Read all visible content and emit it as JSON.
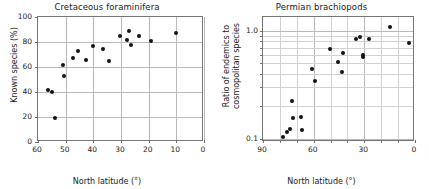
{
  "figure": {
    "panels": [
      {
        "id": "cretaceous-foraminifera",
        "title": "Cretaceous foraminifera",
        "xlabel": "North latitude (°)",
        "ylabel": "Known species (%)",
        "xticks": [
          "60",
          "50",
          "40",
          "30",
          "20",
          "10",
          "0"
        ],
        "yticks": [
          "100",
          "80",
          "60",
          "40",
          "20",
          "0"
        ]
      },
      {
        "id": "permian-brachiopods",
        "title": "Permian brachiopods",
        "xlabel": "North latitude (°)",
        "ylabel_line1": "Ratio of endemics to",
        "ylabel_line2": "cosmopolitan species",
        "xticks": [
          "90",
          "60",
          "30",
          "0"
        ],
        "yticks": [
          "1.0",
          "0.1"
        ]
      }
    ]
  },
  "chart_data": [
    {
      "type": "scatter",
      "title": "Cretaceous foraminifera",
      "xlabel": "North latitude (°)",
      "ylabel": "Known species (%)",
      "xlim": [
        60,
        0
      ],
      "ylim": [
        0,
        100
      ],
      "x_reversed": true,
      "x_tick_values": [
        60,
        50,
        40,
        30,
        20,
        10,
        0
      ],
      "y_tick_values": [
        0,
        20,
        40,
        60,
        80,
        100
      ],
      "y_scale": "linear",
      "grid": "both",
      "legend": "none",
      "points": [
        {
          "x": 56.5,
          "y": 42.0
        },
        {
          "x": 55.0,
          "y": 40.0
        },
        {
          "x": 54.0,
          "y": 19.5
        },
        {
          "x": 51.0,
          "y": 61.5
        },
        {
          "x": 50.5,
          "y": 53.0
        },
        {
          "x": 47.5,
          "y": 67.0
        },
        {
          "x": 45.5,
          "y": 72.5
        },
        {
          "x": 42.5,
          "y": 65.5
        },
        {
          "x": 40.0,
          "y": 76.5
        },
        {
          "x": 36.5,
          "y": 74.5
        },
        {
          "x": 34.5,
          "y": 65.0
        },
        {
          "x": 30.5,
          "y": 84.5
        },
        {
          "x": 28.0,
          "y": 81.5
        },
        {
          "x": 27.0,
          "y": 88.5
        },
        {
          "x": 26.5,
          "y": 77.5
        },
        {
          "x": 23.5,
          "y": 84.5
        },
        {
          "x": 19.0,
          "y": 80.5
        },
        {
          "x": 10.0,
          "y": 87.5
        }
      ]
    },
    {
      "type": "scatter",
      "title": "Permian brachiopods",
      "xlabel": "North latitude (°)",
      "ylabel": "Ratio of endemics to cosmopolitan species",
      "xlim": [
        90,
        0
      ],
      "ylim": [
        0.093,
        1.35
      ],
      "x_reversed": true,
      "x_tick_values": [
        90,
        60,
        30,
        0
      ],
      "x_minor_tick_values": [
        80,
        70,
        50,
        40,
        20,
        10
      ],
      "y_tick_values": [
        0.1,
        1.0
      ],
      "y_minor_tick_values": [
        0.2,
        0.3,
        0.4,
        0.5,
        0.6,
        0.7,
        0.8,
        0.9
      ],
      "y_scale": "log",
      "grid": "both",
      "legend": "none",
      "points": [
        {
          "x": 78.0,
          "y": 0.104
        },
        {
          "x": 76.0,
          "y": 0.115
        },
        {
          "x": 74.0,
          "y": 0.123
        },
        {
          "x": 73.0,
          "y": 0.225
        },
        {
          "x": 72.5,
          "y": 0.155
        },
        {
          "x": 67.5,
          "y": 0.158
        },
        {
          "x": 67.0,
          "y": 0.12
        },
        {
          "x": 61.0,
          "y": 0.44
        },
        {
          "x": 59.0,
          "y": 0.345
        },
        {
          "x": 50.5,
          "y": 0.68
        },
        {
          "x": 45.5,
          "y": 0.52
        },
        {
          "x": 43.5,
          "y": 0.415
        },
        {
          "x": 42.5,
          "y": 0.62
        },
        {
          "x": 35.0,
          "y": 0.84
        },
        {
          "x": 32.5,
          "y": 0.88
        },
        {
          "x": 31.0,
          "y": 0.6
        },
        {
          "x": 31.0,
          "y": 0.57
        },
        {
          "x": 27.0,
          "y": 0.85
        },
        {
          "x": 15.0,
          "y": 1.1
        },
        {
          "x": 3.5,
          "y": 0.78
        }
      ]
    }
  ]
}
